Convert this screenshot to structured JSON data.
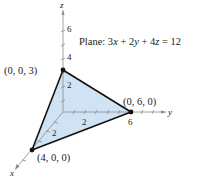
{
  "diagram": {
    "type": "3d-plane-intercepts",
    "plane_label": "Plane: 3x + 2y + 4z = 12",
    "plane_label_parts": {
      "prefix": "Plane: 3",
      "x": "x",
      "p1": " + 2",
      "y": "y",
      "p2": " + 4",
      "z": "z",
      "suffix": " = 12"
    },
    "axes": {
      "x": {
        "label": "x",
        "ticks": [
          "2"
        ]
      },
      "y": {
        "label": "y",
        "ticks": [
          "2",
          "6"
        ]
      },
      "z": {
        "label": "z",
        "ticks": [
          "2",
          "4",
          "6"
        ]
      }
    },
    "points": [
      {
        "label": "(0, 0, 3)",
        "coords": [
          0,
          0,
          3
        ]
      },
      {
        "label": "(0, 6, 0)",
        "coords": [
          0,
          6,
          0
        ]
      },
      {
        "label": "(4, 0, 0)",
        "coords": [
          4,
          0,
          0
        ]
      }
    ],
    "colors": {
      "plane_fill": "#cfe3f5",
      "edge": "#111111",
      "axis": "#888888",
      "text": "#222222"
    }
  }
}
